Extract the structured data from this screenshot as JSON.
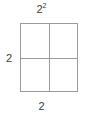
{
  "figure": {
    "type": "area-model-square",
    "labels": {
      "top": {
        "base": "2",
        "exponent": "2",
        "text": "2²"
      },
      "left": {
        "text": "2"
      },
      "bottom": {
        "text": "2"
      }
    },
    "grid": {
      "rows": 2,
      "columns": 2,
      "cells": 4
    },
    "colors": {
      "background": "#ffffff",
      "line": "#9a9a9a",
      "text": "#3a3a3a"
    }
  },
  "chart_data": {
    "type": "table",
    "title": "2²",
    "xlabel": "2",
    "ylabel": "2",
    "categories": [
      "column-1",
      "column-2"
    ],
    "rows": [
      "row-1",
      "row-2"
    ],
    "values": [
      [
        1,
        1
      ],
      [
        1,
        1
      ]
    ],
    "grid": true,
    "legend": "none"
  }
}
